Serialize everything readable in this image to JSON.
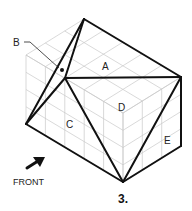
{
  "figure": {
    "number_label": "3.",
    "front_label": "FRONT",
    "face_labels": {
      "A": "A",
      "B": "B",
      "C": "C",
      "D": "D",
      "E": "E"
    },
    "grid": {
      "units_left": 5,
      "units_right": 3,
      "units_high": 4
    },
    "colors": {
      "grid": "#c8c8c8",
      "edges": "#111111"
    }
  }
}
